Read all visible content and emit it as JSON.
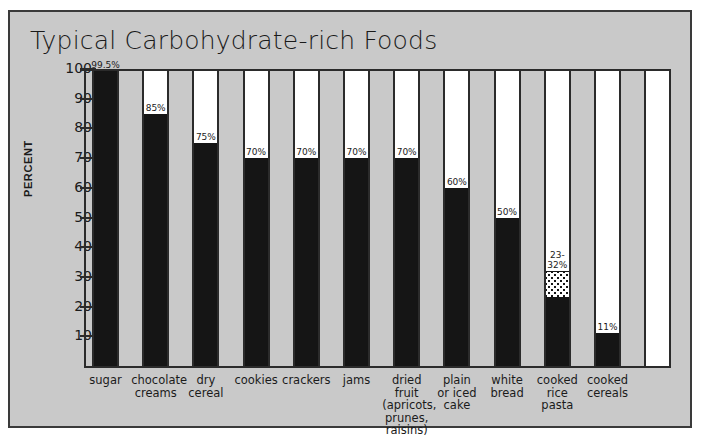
{
  "figure": {
    "panel_background": "#c9c9c9",
    "border_color": "#3a3a3a",
    "bar_color": "#151515"
  },
  "chart_data": {
    "type": "bar",
    "title": "Typical Carbohydrate-rich Foods",
    "xlabel": "",
    "ylabel": "PERCENT",
    "ylim": [
      0,
      100
    ],
    "yticks": [
      10,
      20,
      30,
      40,
      50,
      60,
      70,
      80,
      90,
      100
    ],
    "grid": false,
    "legend": "none",
    "categories": [
      "sugar",
      "chocolate\ncreams",
      "dry\ncereal",
      "cookies",
      "crackers",
      "jams",
      "dried fruit\n(apricots,\nprunes,\nraisins)",
      "plain\nor iced\ncake",
      "white\nbread",
      "cooked\nrice\npasta",
      "cooked\ncereals"
    ],
    "values": [
      99.5,
      85,
      75,
      70,
      70,
      70,
      70,
      60,
      50,
      32,
      11
    ],
    "value_labels": [
      "99.5%",
      "85%",
      "75%",
      "70%",
      "70%",
      "70%",
      "70%",
      "60%",
      "50%",
      "23-\n32%",
      "11%"
    ],
    "bars": [
      {
        "label": "sugar",
        "value": 99.5,
        "value_label": "99.5%",
        "style": "solid"
      },
      {
        "label": "chocolate creams",
        "value": 85,
        "value_label": "85%",
        "style": "solid"
      },
      {
        "label": "dry cereal",
        "value": 75,
        "value_label": "75%",
        "style": "solid"
      },
      {
        "label": "cookies",
        "value": 70,
        "value_label": "70%",
        "style": "solid"
      },
      {
        "label": "crackers",
        "value": 70,
        "value_label": "70%",
        "style": "solid"
      },
      {
        "label": "jams",
        "value": 70,
        "value_label": "70%",
        "style": "solid"
      },
      {
        "label": "dried fruit",
        "value": 70,
        "value_label": "70%",
        "style": "solid"
      },
      {
        "label": "plain or iced cake",
        "value": 60,
        "value_label": "60%",
        "style": "solid"
      },
      {
        "label": "white bread",
        "value": 50,
        "value_label": "50%",
        "style": "solid"
      },
      {
        "label": "cooked rice pasta",
        "value": 32,
        "value_low": 23,
        "value_high": 32,
        "value_label": "23-\n32%",
        "style": "range-stippled"
      },
      {
        "label": "cooked cereals",
        "value": 11,
        "value_label": "11%",
        "style": "solid"
      }
    ],
    "empty_trailing_column": true
  }
}
